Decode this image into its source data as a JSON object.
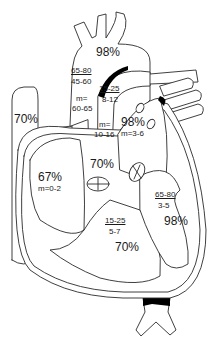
{
  "header": {
    "cropped_title": "···········"
  },
  "diagram": {
    "labels": {
      "aorta_sat": "98%",
      "aorta_pressure_systolic_diastolic": "65-80",
      "aorta_pressure_lower": "45-60",
      "aorta_mean_label": "m=",
      "aorta_mean_value": "60-65",
      "pulmonary_artery_pressure": "15-25",
      "pulmonary_artery_pressure_lower": "8-12",
      "pulmonary_artery_mean_label": "m=",
      "pulmonary_artery_mean_value": "10-16",
      "svc_sat": "70%",
      "left_atrium_sat": "98%",
      "left_atrium_mean": "m=3-6",
      "right_atrium_sat": "67%",
      "right_atrium_mean": "m=0-2",
      "rv_outflow_sat": "70%",
      "left_ventricle_pressure": "65-80",
      "left_ventricle_pressure_lower": "3-5",
      "left_ventricle_sat": "98%",
      "right_ventricle_pressure": "15-25",
      "right_ventricle_pressure_lower": "5-7",
      "right_ventricle_sat": "70%"
    },
    "colors": {
      "stroke": "#2a2a2a",
      "fill": "#ffffff",
      "valve_fill": "#000000"
    }
  }
}
